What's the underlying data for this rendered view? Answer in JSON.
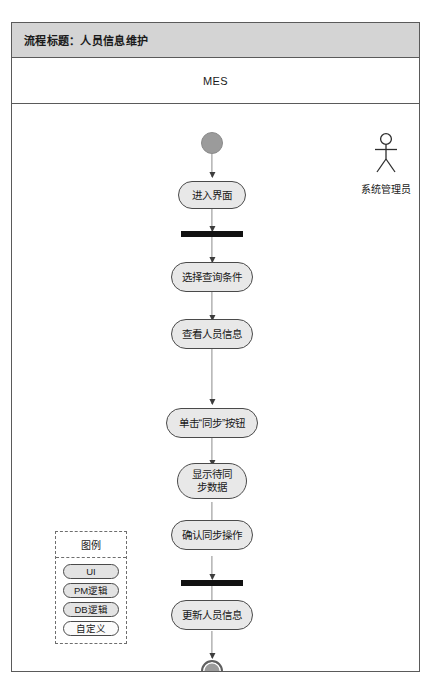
{
  "header": {
    "title_label": "流程标题：人员信息维护",
    "lane_label": "MES"
  },
  "actor": {
    "icon": "actor-stick-figure-icon",
    "label": "系统管理员"
  },
  "flow": {
    "start_node_name": "start-node",
    "end_node_name": "end-node",
    "nodes": [
      {
        "type": "start",
        "label": ""
      },
      {
        "type": "activity",
        "label": "进入界面"
      },
      {
        "type": "bar",
        "label": ""
      },
      {
        "type": "activity",
        "label": "选择查询条件"
      },
      {
        "type": "activity",
        "label": "查看人员信息"
      },
      {
        "type": "activity",
        "label": "单击“同步”按钮"
      },
      {
        "type": "activity",
        "label": "显示待同\n步数据"
      },
      {
        "type": "activity",
        "label": "确认同步操作"
      },
      {
        "type": "bar",
        "label": ""
      },
      {
        "type": "activity",
        "label": "更新人员信息"
      },
      {
        "type": "end",
        "label": ""
      }
    ]
  },
  "legend": {
    "title": "图例",
    "items": [
      {
        "label": "UI",
        "fill": "#e3e3e3"
      },
      {
        "label": "PM逻辑",
        "fill": "#e3e3e3"
      },
      {
        "label": "DB逻辑",
        "fill": "#e3e3e3"
      },
      {
        "label": "自定义",
        "fill": "#fbfbfb"
      }
    ]
  },
  "colors": {
    "frame_border": "#5a5a5a",
    "title_bar_bg": "#d4d4d4",
    "activity_fill": "#e8e8e8",
    "activity_border": "#4a4a4a",
    "start_node_fill": "#9b9b9b",
    "end_node_fill": "#9b9b9b",
    "bar_fill": "#111111",
    "connector": "#8c8c8c"
  }
}
